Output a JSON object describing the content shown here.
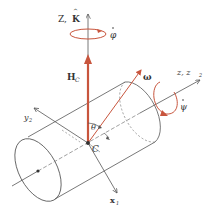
{
  "diagram": {
    "labels": {
      "Z_axis": "Z,",
      "K_hat": "K",
      "phi_dot": "φ",
      "H_main": "H",
      "H_sub": "C",
      "omega": "ω",
      "z_axis": "z, z",
      "z_sub": "2",
      "psi_dot": "ψ",
      "theta": "θ",
      "center": "C",
      "y_axis": "y",
      "y_sub": "2",
      "x_axis": "x",
      "x_sub": "1"
    },
    "colors": {
      "line": "#555555",
      "red": "#c8553d",
      "text": "#333333"
    }
  }
}
